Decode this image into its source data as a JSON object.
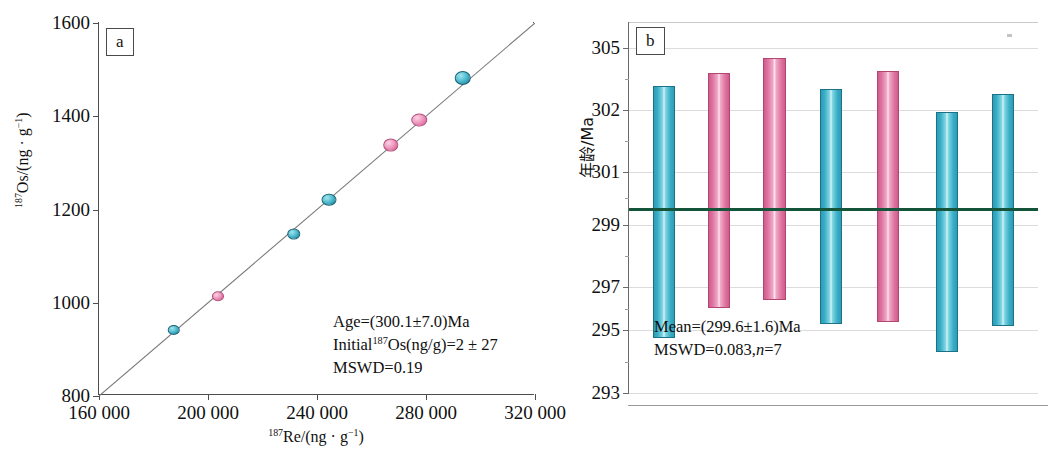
{
  "figure": {
    "panels": [
      {
        "tag": "a"
      },
      {
        "tag": "b"
      }
    ]
  },
  "panel_a": {
    "tag": "a",
    "axis_title_y_parts": {
      "sup": "187",
      "rest": "Os/(ng · g",
      "sup2": "-1",
      "close": ")"
    },
    "axis_title_y_full": "¹⁸⁷Os/(ng · g⁻¹)",
    "axis_title_x_full": "¹⁸⁷Re/(ng · g⁻¹)",
    "ytick_labels": [
      "1600",
      "1400",
      "1200",
      "1000",
      "800"
    ],
    "xtick_labels": [
      "160 000",
      "200 000",
      "240 000",
      "280 000",
      "320 000"
    ],
    "annotation_lines": [
      "Age=(300.1±7.0)Ma",
      "Initial¹⁸⁷Os(ng/g)=2 ± 27",
      "MSWD=0.19"
    ],
    "annotation_age": "Age=(300.1±7.0)Ma",
    "annotation_initial_prefix": "Initial",
    "annotation_initial_sup": "187",
    "annotation_initial_rest": "Os(ng/g)=2 ± 27",
    "annotation_mswd": "MSWD=0.19",
    "colors": {
      "cyan": "#39aec6",
      "pink": "#dd74a0",
      "line": "#7a7a7a",
      "axis": "#4d4d4d"
    }
  },
  "panel_b": {
    "tag": "b",
    "axis_title_y": "年龄/Ma",
    "ytick_labels": [
      "305",
      "302",
      "301",
      "299",
      "297",
      "295",
      "293"
    ],
    "annotation_mean": "Mean=(299.6±1.6)Ma",
    "annotation_mswd_prefix": "MSWD=0.083,",
    "annotation_mswd_n": "n",
    "annotation_mswd_suffix": "=7",
    "colors": {
      "cyan": "#39aec6",
      "pink": "#dd74a0",
      "mean_line": "#14543a",
      "grid": "#dcdcdc"
    }
  },
  "chart_data": [
    {
      "type": "scatter",
      "panel": "a",
      "title": "",
      "xlabel": "187Re/(ng · g-1)",
      "ylabel": "187Os/(ng · g-1)",
      "xlim": [
        160000,
        320000
      ],
      "ylim": [
        800,
        1600
      ],
      "xticks": [
        160000,
        200000,
        240000,
        280000,
        320000
      ],
      "yticks": [
        800,
        1000,
        1200,
        1400,
        1600
      ],
      "xtick_labels": [
        "160 000",
        "200 000",
        "240 000",
        "280 000",
        "320 000"
      ],
      "ytick_labels": [
        "800",
        "1000",
        "1200",
        "1400",
        "1600"
      ],
      "grid": false,
      "legend": "none",
      "fit_line": {
        "type": "isochron",
        "x": [
          160000,
          320000
        ],
        "y": [
          800,
          1600
        ]
      },
      "points": [
        {
          "x": 187500,
          "y": 942,
          "color": "cyan"
        },
        {
          "x": 203500,
          "y": 1014,
          "color": "pink"
        },
        {
          "x": 231500,
          "y": 1148,
          "color": "cyan"
        },
        {
          "x": 244500,
          "y": 1221,
          "color": "cyan"
        },
        {
          "x": 267000,
          "y": 1338,
          "color": "pink"
        },
        {
          "x": 277500,
          "y": 1391,
          "color": "pink"
        },
        {
          "x": 293500,
          "y": 1483,
          "color": "cyan"
        }
      ],
      "annotations": [
        "Age=(300.1±7.0)Ma",
        "Initial187Os(ng/g)=2 ± 27",
        "MSWD=0.19"
      ],
      "age_ma": 300.1,
      "age_error_ma": 7.0,
      "initial_187os_ng_g": 2,
      "initial_187os_error": 27,
      "mswd": 0.19
    },
    {
      "type": "bar",
      "panel": "b",
      "subtype": "weighted-mean-error-bars",
      "title": "",
      "xlabel": "",
      "ylabel": "年龄/Ma",
      "ylim": [
        293,
        306
      ],
      "yticks": [
        293,
        295,
        297,
        299,
        301,
        302,
        305
      ],
      "ytick_labels": [
        "293",
        "295",
        "297",
        "299",
        "301",
        "302",
        "305"
      ],
      "grid": true,
      "legend": "none",
      "categories": [
        "1",
        "2",
        "3",
        "4",
        "5",
        "6",
        "7"
      ],
      "bars": [
        {
          "index": 1,
          "center": 299.7,
          "high": 304.4,
          "low": 294.9,
          "color": "cyan"
        },
        {
          "index": 2,
          "center": 299.8,
          "high": 305.0,
          "low": 295.9,
          "color": "pink"
        },
        {
          "index": 3,
          "center": 299.8,
          "high": 305.3,
          "low": 296.2,
          "color": "pink"
        },
        {
          "index": 4,
          "center": 299.5,
          "high": 304.3,
          "low": 295.2,
          "color": "cyan"
        },
        {
          "index": 5,
          "center": 299.9,
          "high": 305.1,
          "low": 295.2,
          "color": "pink"
        },
        {
          "index": 6,
          "center": 299.0,
          "high": 303.8,
          "low": 294.3,
          "color": "cyan"
        },
        {
          "index": 7,
          "center": 299.6,
          "high": 304.2,
          "low": 295.1,
          "color": "cyan"
        }
      ],
      "mean_line": 299.6,
      "mean_ma": 299.6,
      "mean_error_ma": 1.6,
      "mswd": 0.083,
      "n": 7,
      "annotations": [
        "Mean=(299.6±1.6)Ma",
        "MSWD=0.083,n=7"
      ]
    }
  ]
}
